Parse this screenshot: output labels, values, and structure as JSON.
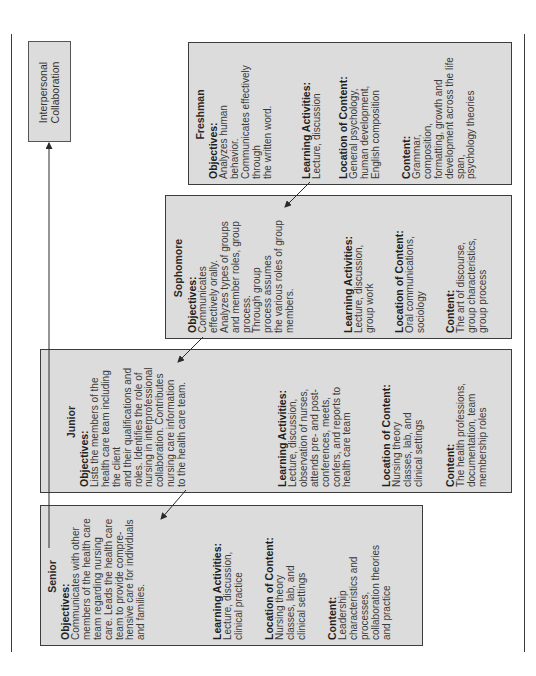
{
  "root_box": {
    "lines": [
      "Interpersonal",
      "Collaboration"
    ]
  },
  "boxes": [
    {
      "title": "Freshman",
      "objectives": {
        "label": "Objectives:",
        "lines": [
          "Analyzes human",
          "behavior.",
          "Communicates effectively",
          "through",
          "the written word."
        ]
      },
      "learning_activities": {
        "label": "Learning Activities:",
        "lines": [
          "Lecture, discussion"
        ]
      },
      "location_of_content": {
        "label": "Location of Content:",
        "lines": [
          "General psychology,",
          "human development,",
          "English composition"
        ]
      },
      "content": {
        "label": "Content:",
        "lines": [
          "Grammar,",
          "composition,",
          "formatting, growth and",
          "development across the life",
          "span,",
          "psychology theories"
        ]
      }
    },
    {
      "title": "Sophomore",
      "objectives": {
        "label": "Objectives:",
        "lines": [
          "Communicates",
          "effectively orally.",
          "Analyzes types of groups",
          "and member roles, group",
          "process.",
          "Through group",
          "process assumes",
          "the various roles of group",
          "members."
        ]
      },
      "learning_activities": {
        "label": "Learning Activities:",
        "lines": [
          "Lecture, discussion,",
          "group work"
        ]
      },
      "location_of_content": {
        "label": "Location of Content:",
        "lines": [
          "Oral communications,",
          "sociology"
        ]
      },
      "content": {
        "label": "Content:",
        "lines": [
          "The art of discourse,",
          "group characteristics,",
          "group process"
        ]
      }
    },
    {
      "title": "Junior",
      "objectives": {
        "label": "Objectives:",
        "lines": [
          "Lists the members of the",
          "health care team including",
          "the client",
          "and their qualifications and",
          "roles. Identifies the role of",
          "nursing in interprofessional",
          "collaboration. Contributes",
          "nursing care information",
          "to the health care team."
        ]
      },
      "learning_activities": {
        "label": "Learning Activities:",
        "lines": [
          "Lecture, discussion,",
          "observation of nurses,",
          "attends pre- and post-",
          "conferences, meets,",
          "confers, and reports to",
          "health care team"
        ]
      },
      "location_of_content": {
        "label": "Location of Content:",
        "lines": [
          "Nursing theory",
          "classes, lab, and",
          "clinical settings"
        ]
      },
      "content": {
        "label": "Content:",
        "lines": [
          "The health professions,",
          "documentation, team",
          "membership roles"
        ]
      }
    },
    {
      "title": "Senior",
      "objectives": {
        "label": "Objectives:",
        "lines": [
          "Communicates with other",
          "members of the health care",
          "team regarding nursing",
          "care. Leads the health care",
          "team to provide compre-",
          "hensive care for individuals",
          "and families."
        ]
      },
      "learning_activities": {
        "label": "Learning Activities:",
        "lines": [
          "Lecture, discussion,",
          "clinical practice"
        ]
      },
      "location_of_content": {
        "label": "Location of Content:",
        "lines": [
          "Nursing theory",
          "classes, lab, and",
          "clinical settings"
        ]
      },
      "content": {
        "label": "Content:",
        "lines": [
          "Leadership",
          "characteristics and",
          "processes,",
          "collaboration theories",
          "and practice"
        ]
      }
    }
  ],
  "colors": {
    "box_fill": "#dcdcdc",
    "box_border": "#3c3c3c",
    "line": "#3a3a3a"
  }
}
